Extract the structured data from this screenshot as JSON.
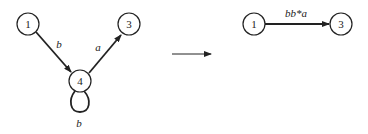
{
  "left_graph": {
    "nodes": [
      {
        "id": "1",
        "label": "1"
      },
      {
        "id": "3",
        "label": "3"
      },
      {
        "id": "4",
        "label": "4"
      }
    ],
    "edges": [
      {
        "from": "1",
        "to": "4",
        "label": "b"
      },
      {
        "from": "4",
        "to": "3",
        "label": "a"
      },
      {
        "from": "4",
        "to": "4",
        "label": "b"
      }
    ]
  },
  "transform_arrow": "reduces-to",
  "right_graph": {
    "nodes": [
      {
        "id": "1",
        "label": "1"
      },
      {
        "id": "3",
        "label": "3"
      }
    ],
    "edges": [
      {
        "from": "1",
        "to": "3",
        "label": "bb*a"
      }
    ]
  }
}
